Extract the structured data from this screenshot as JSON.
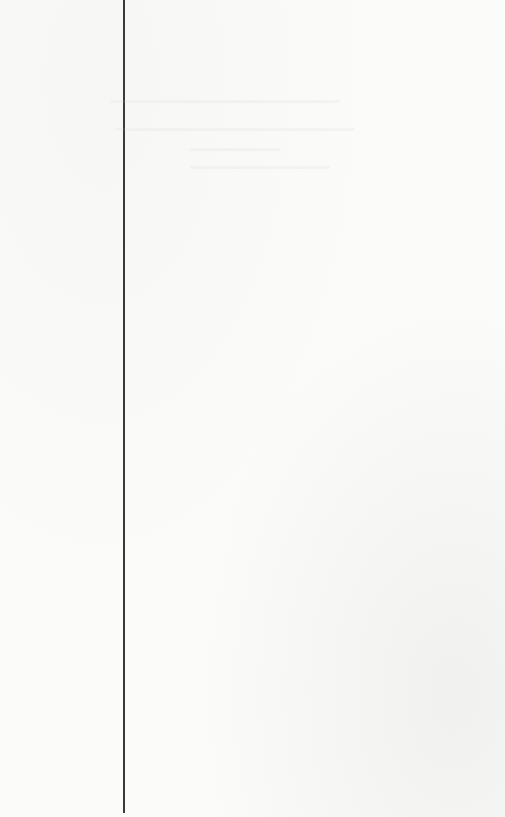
{
  "page": {
    "background_color": "#fbfbfa",
    "rule": {
      "color": "#3a3a3a",
      "x": 123,
      "top": 0,
      "height": 813
    },
    "text": ""
  }
}
